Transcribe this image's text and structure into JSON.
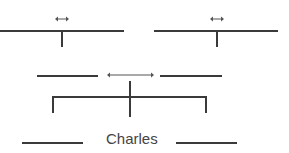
{
  "diagram": {
    "type": "family-tree-pedigree",
    "colors": {
      "line": "#3a3a3a",
      "arrow": "#555555",
      "text": "#444444"
    },
    "nodes": [
      {
        "id": "grandparent-left",
        "label": "",
        "blank": true
      },
      {
        "id": "grandparent-right",
        "label": "",
        "blank": true
      },
      {
        "id": "parent-left",
        "label": "",
        "blank": true
      },
      {
        "id": "parent-right",
        "label": "",
        "blank": true
      },
      {
        "id": "sibling-left",
        "label": "",
        "blank": true
      },
      {
        "id": "focus-person",
        "label": "Charles"
      },
      {
        "id": "sibling-right",
        "label": "",
        "blank": true
      }
    ],
    "connectors": [
      {
        "type": "double-arrow",
        "location": "top-left"
      },
      {
        "type": "double-arrow",
        "location": "top-right"
      },
      {
        "type": "double-arrow",
        "location": "middle"
      }
    ]
  }
}
